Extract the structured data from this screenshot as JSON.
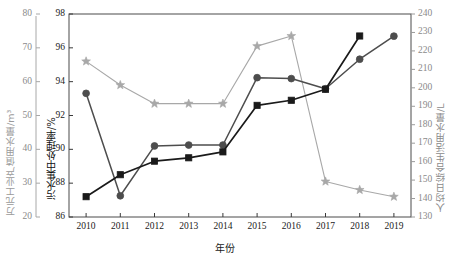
{
  "chart_data": {
    "type": "line",
    "title": "",
    "xlabel": "年份",
    "categories": [
      "2010",
      "2011",
      "2012",
      "2013",
      "2014",
      "2015",
      "2016",
      "2017",
      "2018",
      "2019"
    ],
    "axes": {
      "left_outer": {
        "label": "万元工业产值用水量/m³",
        "ticks": [
          20,
          30,
          40,
          50,
          60,
          70,
          80
        ],
        "ylim": [
          20,
          80
        ],
        "color": "#9a9a9a"
      },
      "left_inner": {
        "label": "污水集中处理率/%",
        "ticks": [
          86,
          88,
          90,
          92,
          94,
          96,
          98
        ],
        "ylim": [
          86,
          98
        ],
        "color": "#1a1a1a"
      },
      "right": {
        "label": "人均日综合生活用水量/L",
        "ticks": [
          130,
          140,
          150,
          160,
          170,
          180,
          190,
          200,
          210,
          220,
          230,
          240
        ],
        "ylim": [
          130,
          240
        ],
        "color": "#8a8a8a"
      }
    },
    "grid": false,
    "legend": "none",
    "series": [
      {
        "name": "万元工业产值用水量",
        "marker": "star",
        "color": "#a8a8a8",
        "axis": "left_outer",
        "values": [
          66.0,
          59.0,
          53.5,
          53.5,
          53.5,
          70.5,
          73.5,
          30.5,
          28.0,
          26.0
        ]
      },
      {
        "name": "人均日综合生活用水量",
        "marker": "circle",
        "color": "#4d4d4d",
        "axis": "right",
        "values": [
          197.0,
          141.5,
          168.5,
          169.0,
          169.0,
          205.5,
          205.0,
          199.5,
          215.5,
          228.0
        ]
      },
      {
        "name": "污水集中处理率",
        "marker": "square",
        "color": "#1a1a1a",
        "axis": "left_inner",
        "values": [
          87.2,
          88.5,
          89.3,
          89.5,
          89.85,
          92.6,
          92.9,
          93.55,
          96.7,
          null
        ]
      }
    ]
  }
}
